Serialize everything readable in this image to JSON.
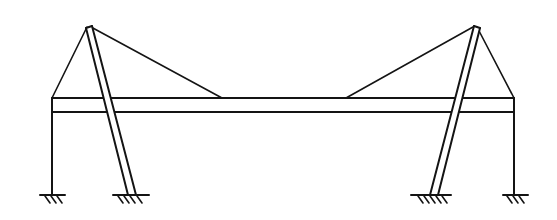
{
  "diagram": {
    "type": "structural-sketch",
    "colors": {
      "line": "#141414",
      "background": "#ffffff"
    },
    "deck": {
      "x1": 52,
      "x2": 514,
      "y_top": 98,
      "y_bottom": 112
    },
    "pylons": [
      {
        "side": "left",
        "apex": [
          88,
          27
        ],
        "base": [
          130,
          195
        ]
      },
      {
        "side": "right",
        "apex": [
          476,
          27
        ],
        "base": [
          433,
          195
        ]
      }
    ],
    "columns": [
      {
        "side": "left",
        "x": 52,
        "base_y": 195
      },
      {
        "side": "right",
        "x": 514,
        "base_y": 195
      }
    ],
    "cables": [
      {
        "from": [
          88,
          27
        ],
        "to": [
          52,
          98
        ]
      },
      {
        "from": [
          88,
          27
        ],
        "to": [
          222,
          98
        ]
      },
      {
        "from": [
          476,
          27
        ],
        "to": [
          346,
          98
        ]
      },
      {
        "from": [
          476,
          27
        ],
        "to": [
          514,
          98
        ]
      }
    ],
    "supports": [
      {
        "type": "fixed",
        "at": [
          52,
          195
        ]
      },
      {
        "type": "fixed",
        "at": [
          130,
          195
        ]
      },
      {
        "type": "fixed",
        "at": [
          433,
          195
        ]
      },
      {
        "type": "fixed",
        "at": [
          514,
          195
        ]
      }
    ]
  }
}
